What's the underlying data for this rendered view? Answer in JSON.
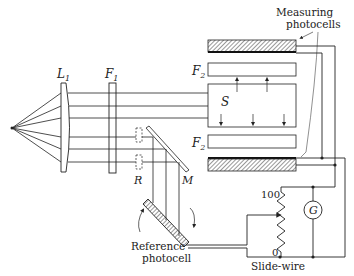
{
  "diagram": {
    "type": "optical-photometer-schematic",
    "labels": {
      "lens": "L",
      "lens_sub": "1",
      "filter1": "F",
      "filter1_sub": "1",
      "filter2_top": "F",
      "filter2_top_sub": "2",
      "filter2_bottom": "F",
      "filter2_bottom_sub": "2",
      "sample": "S",
      "reference_slot": "R",
      "mirror": "M",
      "galvanometer": "G",
      "measuring_photocells_line1": "Measuring",
      "measuring_photocells_line2": "photocells",
      "reference_photocell_line1": "Reference",
      "reference_photocell_line2": "photocell",
      "slide_wire": "Slide-wire",
      "slide_wire_max": "100",
      "slide_wire_min": "0"
    },
    "colors": {
      "line": "#222222",
      "background": "#ffffff"
    }
  }
}
